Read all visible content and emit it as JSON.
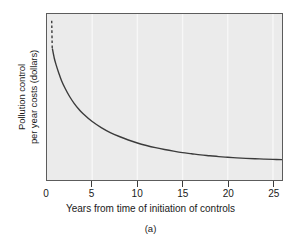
{
  "figure": {
    "caption": "(a)"
  },
  "chart_data": {
    "type": "line",
    "title": "",
    "subtitle": "",
    "xlabel": "Years from time of initiation of controls",
    "ylabel": "Pollution control\nper year costs (dollars)",
    "ylabel_lines": [
      "Pollution control",
      "per year costs (dollars)"
    ],
    "xlim": [
      0,
      26
    ],
    "ylim": [
      0,
      1
    ],
    "xticks": [
      0,
      5,
      10,
      15,
      20,
      25
    ],
    "xticklabels": [
      "0",
      "5",
      "10",
      "15",
      "20",
      "25"
    ],
    "yticks": [],
    "yticklabels": [],
    "grid": "vertical-only",
    "grid_color": "#f7f7f7",
    "plot_background": "#ebebeb",
    "axis_color": "#5c5c5c",
    "legend": null,
    "legend_position": "none",
    "annotations": [
      {
        "name": "dashed-extension",
        "style": "dashed",
        "description": "Dashed vertical continuation of the curve above its plotted start, indicating costs rising off-scale near year zero.",
        "x": [
          0.52,
          0.58
        ],
        "y": [
          0.96,
          0.79
        ]
      }
    ],
    "series": [
      {
        "name": "Pollution control cost per year",
        "style": "solid",
        "color": "#3b3b3b",
        "linewidth": 1.4,
        "x": [
          0.6,
          0.8,
          1.0,
          1.3,
          1.6,
          2.0,
          2.5,
          3.0,
          3.5,
          4.0,
          5.0,
          6.0,
          7.0,
          8.0,
          9.0,
          10.0,
          11.0,
          12.0,
          13.0,
          14.0,
          15.0,
          16.0,
          17.0,
          18.0,
          19.0,
          20.0,
          21.0,
          22.0,
          23.0,
          24.0,
          25.0,
          26.0
        ],
        "y": [
          0.79,
          0.735,
          0.695,
          0.645,
          0.6,
          0.553,
          0.503,
          0.462,
          0.428,
          0.399,
          0.352,
          0.316,
          0.286,
          0.262,
          0.241,
          0.223,
          0.208,
          0.195,
          0.184,
          0.174,
          0.165,
          0.158,
          0.151,
          0.146,
          0.141,
          0.137,
          0.133,
          0.13,
          0.128,
          0.126,
          0.124,
          0.123
        ]
      }
    ]
  }
}
